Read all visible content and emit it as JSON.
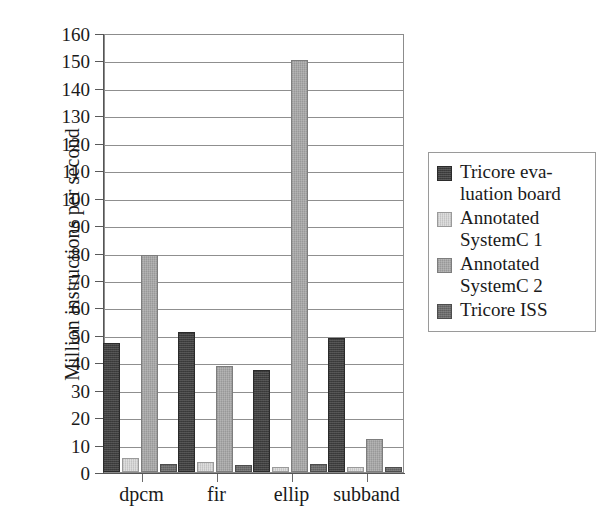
{
  "chart_data": {
    "type": "bar",
    "title": "",
    "subtitle": "",
    "xlabel": "",
    "ylabel": "Million instructions per second",
    "categories": [
      "dpcm",
      "fir",
      "ellip",
      "subband"
    ],
    "ylim": [
      0,
      160
    ],
    "ytick_step": 10,
    "yticks": [
      0,
      10,
      20,
      30,
      40,
      50,
      60,
      70,
      80,
      90,
      100,
      110,
      120,
      130,
      140,
      150,
      160
    ],
    "ytick_labels": [
      "0",
      "10",
      "20",
      "30",
      "40",
      "50",
      "60",
      "70",
      "80",
      "90",
      "100",
      "110",
      "120",
      "130",
      "140",
      "150",
      "160"
    ],
    "grid": true,
    "grid_axis": "y",
    "legend_position": "right",
    "series": [
      {
        "name": "Tricore evaluation board",
        "name_lines": [
          "Tricore eva-",
          "luation board"
        ],
        "color": "#3f3f3f",
        "values": [
          47,
          51,
          37,
          49
        ]
      },
      {
        "name": "Annotated SystemC 1",
        "name_lines": [
          "Annotated",
          "SystemC 1"
        ],
        "color": "#d9d9d9",
        "values": [
          5,
          3.5,
          2,
          2
        ]
      },
      {
        "name": "Annotated SystemC 2",
        "name_lines": [
          "Annotated",
          "SystemC 2"
        ],
        "color": "#a9a9a9",
        "values": [
          79,
          38.5,
          150,
          12
        ]
      },
      {
        "name": "Tricore ISS",
        "name_lines": [
          "Tricore ISS"
        ],
        "color": "#6b6b6b",
        "values": [
          3,
          2.5,
          3,
          2
        ]
      }
    ]
  }
}
